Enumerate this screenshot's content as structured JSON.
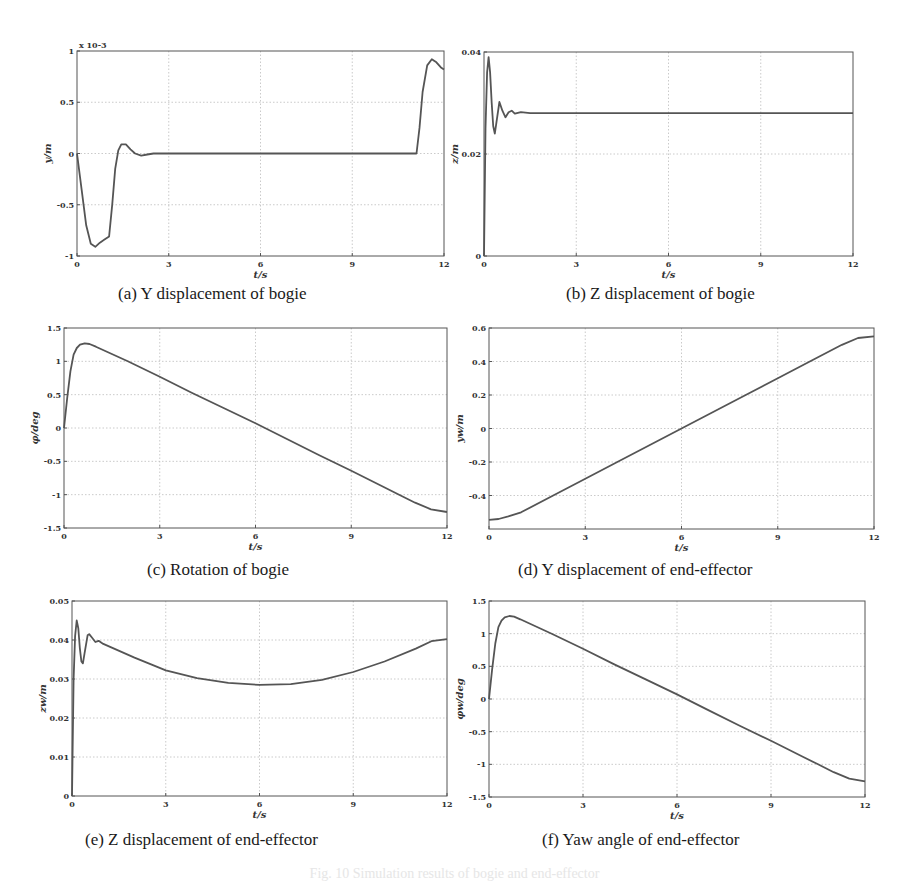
{
  "figure_caption": "Fig. 10  Simulation results of bogie and end-effector",
  "chart_data": [
    {
      "id": "a",
      "type": "line",
      "caption": "(a)  Y displacement of bogie",
      "title": "",
      "xlabel": "t/s",
      "ylabel": "y/m",
      "y_multiplier_label": "x 10^-3",
      "xlim": [
        0,
        12
      ],
      "ylim": [
        -1,
        1
      ],
      "xticks": [
        0,
        3,
        6,
        9,
        12
      ],
      "yticks": [
        -1,
        -0.5,
        0,
        0.5,
        1
      ],
      "ytick_labels": [
        "-1",
        "-0.5",
        "0",
        "0.5",
        "1"
      ],
      "grid": true,
      "box": {
        "left": 77,
        "top": 51,
        "width": 367,
        "height": 205
      },
      "series": [
        {
          "name": "y",
          "x": [
            0,
            0.15,
            0.3,
            0.45,
            0.6,
            0.75,
            0.9,
            1.05,
            1.15,
            1.25,
            1.35,
            1.45,
            1.6,
            1.75,
            1.9,
            2.1,
            2.3,
            2.5,
            4,
            6,
            8,
            10,
            11.1,
            11.2,
            11.3,
            11.45,
            11.6,
            11.75,
            11.9,
            12
          ],
          "y": [
            0,
            -0.35,
            -0.7,
            -0.88,
            -0.91,
            -0.87,
            -0.84,
            -0.81,
            -0.5,
            -0.15,
            0.03,
            0.09,
            0.09,
            0.04,
            0.0,
            -0.02,
            -0.01,
            0,
            0,
            0,
            0,
            0,
            0,
            0.25,
            0.6,
            0.86,
            0.92,
            0.89,
            0.84,
            0.82
          ]
        }
      ]
    },
    {
      "id": "b",
      "type": "line",
      "caption": "(b)  Z displacement of bogie",
      "title": "",
      "xlabel": "t/s",
      "ylabel": "z/m",
      "xlim": [
        0,
        12
      ],
      "ylim": [
        0,
        0.04
      ],
      "xticks": [
        0,
        3,
        6,
        9,
        12
      ],
      "yticks": [
        0,
        0.02,
        0.04
      ],
      "ytick_labels": [
        "0",
        "0.02",
        "0.04"
      ],
      "grid": true,
      "box": {
        "left": 484,
        "top": 52,
        "width": 369,
        "height": 204
      },
      "series": [
        {
          "name": "z",
          "x": [
            0,
            0.05,
            0.1,
            0.15,
            0.2,
            0.25,
            0.3,
            0.35,
            0.4,
            0.5,
            0.6,
            0.7,
            0.8,
            0.9,
            1.0,
            1.2,
            1.5,
            3,
            6,
            9,
            12
          ],
          "y": [
            0,
            0.025,
            0.036,
            0.039,
            0.036,
            0.03,
            0.0255,
            0.024,
            0.026,
            0.0302,
            0.0285,
            0.0272,
            0.0282,
            0.0285,
            0.0279,
            0.0282,
            0.028,
            0.028,
            0.028,
            0.028,
            0.028
          ]
        }
      ]
    },
    {
      "id": "c",
      "type": "line",
      "caption": "(c)  Rotation of bogie",
      "title": "",
      "xlabel": "t/s",
      "ylabel": "φ/deg",
      "xlim": [
        0,
        12
      ],
      "ylim": [
        -1.5,
        1.5
      ],
      "xticks": [
        0,
        3,
        6,
        9,
        12
      ],
      "yticks": [
        -1.5,
        -1,
        -0.5,
        0,
        0.5,
        1,
        1.5
      ],
      "ytick_labels": [
        "-1.5",
        "-1",
        "-0.5",
        "0",
        "0.5",
        "1",
        "1.5"
      ],
      "grid": true,
      "box": {
        "left": 64,
        "top": 328,
        "width": 383,
        "height": 200
      },
      "series": [
        {
          "name": "phi",
          "x": [
            0,
            0.1,
            0.2,
            0.3,
            0.4,
            0.5,
            0.65,
            0.8,
            1,
            2,
            3,
            4,
            5,
            6,
            7,
            8,
            9,
            10,
            10.5,
            11,
            11.5,
            12
          ],
          "y": [
            0,
            0.45,
            0.85,
            1.1,
            1.2,
            1.25,
            1.27,
            1.26,
            1.22,
            1.0,
            0.77,
            0.53,
            0.3,
            0.07,
            -0.17,
            -0.41,
            -0.64,
            -0.88,
            -1.0,
            -1.12,
            -1.22,
            -1.26
          ]
        }
      ]
    },
    {
      "id": "d",
      "type": "line",
      "caption": "(d)  Y displacement of end-effector",
      "title": "",
      "xlabel": "t/s",
      "ylabel": "y_w/m",
      "xlim": [
        0,
        12
      ],
      "ylim": [
        -0.6,
        0.6
      ],
      "xticks": [
        0,
        3,
        6,
        9,
        12
      ],
      "yticks": [
        -0.4,
        -0.2,
        0,
        0.2,
        0.4,
        0.6
      ],
      "ytick_labels": [
        "-0.4",
        "-0.2",
        "0",
        "0.2",
        "0.4",
        "0.6"
      ],
      "grid": true,
      "box": {
        "left": 489,
        "top": 328,
        "width": 385,
        "height": 201
      },
      "series": [
        {
          "name": "y_w",
          "x": [
            0,
            0.3,
            0.6,
            1,
            2,
            3,
            4,
            5,
            6,
            7,
            8,
            9,
            10,
            11,
            11.5,
            12
          ],
          "y": [
            -0.545,
            -0.54,
            -0.525,
            -0.5,
            -0.4,
            -0.3,
            -0.2,
            -0.1,
            0.0,
            0.1,
            0.2,
            0.3,
            0.4,
            0.5,
            0.54,
            0.55
          ]
        }
      ]
    },
    {
      "id": "e",
      "type": "line",
      "caption": "(e)  Z displacement of end-effector",
      "title": "",
      "xlabel": "t/s",
      "ylabel": "z_w/m",
      "xlim": [
        0,
        12
      ],
      "ylim": [
        0,
        0.05
      ],
      "xticks": [
        0,
        3,
        6,
        9,
        12
      ],
      "yticks": [
        0,
        0.01,
        0.02,
        0.03,
        0.04,
        0.05
      ],
      "ytick_labels": [
        "0",
        "0.01",
        "0.02",
        "0.03",
        "0.04",
        "0.05"
      ],
      "grid": true,
      "box": {
        "left": 72,
        "top": 601,
        "width": 375,
        "height": 195
      },
      "series": [
        {
          "name": "z_w",
          "x": [
            0,
            0.05,
            0.1,
            0.15,
            0.2,
            0.25,
            0.3,
            0.35,
            0.4,
            0.5,
            0.55,
            0.65,
            0.75,
            0.85,
            1,
            2,
            3,
            4,
            5,
            6,
            7,
            8,
            9,
            10,
            11,
            11.5,
            12
          ],
          "y": [
            0,
            0.03,
            0.041,
            0.045,
            0.043,
            0.038,
            0.0345,
            0.034,
            0.0365,
            0.0412,
            0.0415,
            0.0405,
            0.0395,
            0.0398,
            0.039,
            0.0355,
            0.0322,
            0.0302,
            0.029,
            0.0285,
            0.0287,
            0.0298,
            0.0318,
            0.0345,
            0.0378,
            0.0397,
            0.0402
          ]
        }
      ]
    },
    {
      "id": "f",
      "type": "line",
      "caption": "(f)  Yaw angle of end-effector",
      "title": "",
      "xlabel": "t/s",
      "ylabel": "φ_w/deg",
      "xlim": [
        0,
        12
      ],
      "ylim": [
        -1.5,
        1.5
      ],
      "xticks": [
        0,
        3,
        6,
        9,
        12
      ],
      "yticks": [
        -1.5,
        -1,
        -0.5,
        0,
        0.5,
        1,
        1.5
      ],
      "ytick_labels": [
        "-1.5",
        "-1",
        "-0.5",
        "0",
        "0.5",
        "1",
        "1.5"
      ],
      "grid": true,
      "box": {
        "left": 489,
        "top": 601,
        "width": 376,
        "height": 196
      },
      "series": [
        {
          "name": "phi_w",
          "x": [
            0,
            0.1,
            0.2,
            0.3,
            0.4,
            0.5,
            0.65,
            0.8,
            1,
            2,
            3,
            4,
            5,
            6,
            7,
            8,
            9,
            10,
            10.5,
            11,
            11.5,
            12
          ],
          "y": [
            0,
            0.45,
            0.85,
            1.1,
            1.2,
            1.25,
            1.27,
            1.26,
            1.22,
            1.0,
            0.77,
            0.53,
            0.3,
            0.07,
            -0.17,
            -0.41,
            -0.64,
            -0.88,
            -1.0,
            -1.12,
            -1.22,
            -1.26
          ]
        }
      ]
    }
  ],
  "captions": {
    "a": "(a)  Y displacement of bogie",
    "b": "(b)  Z displacement of bogie",
    "c": "(c)  Rotation of bogie",
    "d": "(d)  Y displacement of end-effector",
    "e": "(e)  Z displacement of end-effector",
    "f": "(f)  Yaw angle of end-effector"
  },
  "caption_pos": {
    "a": {
      "left": 118,
      "top": 284
    },
    "b": {
      "left": 566,
      "top": 284
    },
    "c": {
      "left": 147,
      "top": 560
    },
    "d": {
      "left": 518,
      "top": 560
    },
    "e": {
      "left": 85,
      "top": 830
    },
    "f": {
      "left": 542,
      "top": 830
    }
  },
  "style": {
    "line_color": "#555555",
    "grid_color": "#bdbdbd",
    "frame_color": "#555555",
    "text_color": "#333333"
  }
}
